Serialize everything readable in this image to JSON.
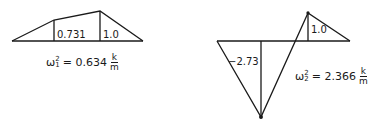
{
  "mode1": {
    "labels": {
      "left_ordinate": "0.731",
      "right_ordinate": "1.0"
    },
    "equation": {
      "symbol": "ω",
      "sup": "2",
      "sub": "1",
      "equals": "=",
      "value": "0.634",
      "unit_num": "k",
      "unit_den": "m"
    }
  },
  "mode2": {
    "labels": {
      "negative_ordinate": "−2.73",
      "positive_ordinate": "1.0"
    },
    "equation": {
      "symbol": "ω",
      "sup": "2",
      "sub": "2",
      "equals": "=",
      "value": "2.366",
      "unit_num": "k",
      "unit_den": "m"
    }
  },
  "colors": {
    "line": "#1a1a1a",
    "background": "#ffffff"
  }
}
